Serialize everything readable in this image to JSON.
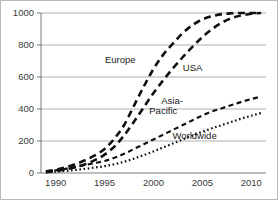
{
  "chart_data": {
    "type": "line",
    "title": "",
    "subtitle": "",
    "xlabel": "",
    "ylabel": "",
    "xlim": [
      1988.5,
      2011.5
    ],
    "ylim": [
      0,
      1000
    ],
    "grid": true,
    "legend_position": "inline-annotations",
    "x_ticks": [
      "1990",
      "1995",
      "2000",
      "2005",
      "2010"
    ],
    "x_tick_values": [
      1990,
      1995,
      2000,
      2005,
      2010
    ],
    "y_ticks": [
      "0",
      "200",
      "400",
      "600",
      "800",
      "1000"
    ],
    "y_tick_values": [
      0,
      200,
      400,
      600,
      800,
      1000
    ],
    "x": [
      1989,
      1990,
      1991,
      1992,
      1993,
      1994,
      1995,
      1996,
      1997,
      1998,
      1999,
      2000,
      2001,
      2002,
      2003,
      2004,
      2005,
      2006,
      2007,
      2008,
      2009,
      2010,
      2011
    ],
    "series": [
      {
        "name": "Europe",
        "label": "Europe",
        "style": "long-dash",
        "color": "#111111",
        "values": [
          10,
          20,
          35,
          55,
          80,
          110,
          150,
          215,
          300,
          420,
          540,
          650,
          740,
          810,
          875,
          925,
          960,
          980,
          993,
          998,
          1000,
          1000,
          1000
        ]
      },
      {
        "name": "USA",
        "label": "USA",
        "style": "long-dash",
        "color": "#111111",
        "values": [
          5,
          12,
          22,
          36,
          55,
          80,
          115,
          165,
          235,
          320,
          410,
          500,
          580,
          655,
          725,
          790,
          850,
          900,
          940,
          968,
          985,
          995,
          1000
        ]
      },
      {
        "name": "Asia-Pacific",
        "label": "Asia-\nPacific",
        "label_line1": "Asia-",
        "label_line2": "Pacific",
        "style": "short-dash",
        "color": "#111111",
        "values": [
          8,
          16,
          26,
          38,
          50,
          62,
          75,
          95,
          120,
          150,
          180,
          210,
          240,
          270,
          300,
          330,
          360,
          385,
          405,
          425,
          445,
          462,
          478
        ]
      },
      {
        "name": "Worldwide",
        "label": "Worldwide",
        "style": "dotted",
        "color": "#111111",
        "values": [
          4,
          8,
          13,
          19,
          26,
          34,
          43,
          55,
          70,
          90,
          112,
          135,
          160,
          185,
          210,
          235,
          258,
          280,
          300,
          320,
          340,
          358,
          375
        ]
      }
    ],
    "annotations": [
      {
        "text": "Europe",
        "x": 1996.6,
        "y": 690
      },
      {
        "text": "USA",
        "x": 2004.0,
        "y": 640
      },
      {
        "text": "Asia-",
        "x": 2001.9,
        "y": 430
      },
      {
        "text": "Pacific",
        "x": 2001.0,
        "y": 370
      },
      {
        "text": "Worldwide",
        "x": 2004.2,
        "y": 210
      }
    ]
  }
}
